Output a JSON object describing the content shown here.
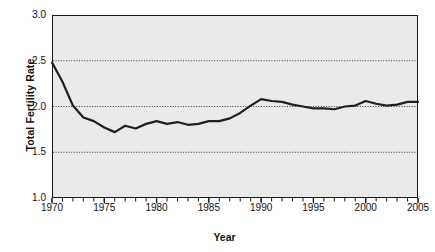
{
  "chart_data": {
    "type": "line",
    "title": "",
    "xlabel": "Year",
    "ylabel": "Total Fertility Rate",
    "xlim": [
      1970,
      2005
    ],
    "ylim": [
      1.0,
      3.0
    ],
    "xticks": [
      1970,
      1975,
      1980,
      1985,
      1990,
      1995,
      2000,
      2005
    ],
    "xtick_labels": [
      "1970",
      "1975",
      "1980",
      "1985",
      "1990",
      "1995",
      "2000",
      "2005"
    ],
    "minor_xtick_interval": 1,
    "yticks": [
      1.0,
      1.5,
      2.0,
      2.5,
      3.0
    ],
    "ytick_labels": [
      "1.0",
      "1.5",
      "2.0",
      "2.5",
      "3.0"
    ],
    "gridlines_y": [
      1.5,
      2.0,
      2.5
    ],
    "grid": "horizontal-dotted",
    "legend": "none",
    "plot_background": "#eaeaea",
    "line_color": "#1f1f1f",
    "axis_color": "#1a1a1a",
    "line_width": 2.2,
    "x": [
      1970,
      1971,
      1972,
      1973,
      1974,
      1975,
      1976,
      1977,
      1978,
      1979,
      1980,
      1981,
      1982,
      1983,
      1984,
      1985,
      1986,
      1987,
      1988,
      1989,
      1990,
      1991,
      1992,
      1993,
      1994,
      1995,
      1996,
      1997,
      1998,
      1999,
      2000,
      2001,
      2002,
      2003,
      2004,
      2005
    ],
    "values": [
      2.48,
      2.27,
      2.01,
      1.88,
      1.84,
      1.77,
      1.72,
      1.79,
      1.76,
      1.81,
      1.84,
      1.81,
      1.83,
      1.8,
      1.81,
      1.84,
      1.84,
      1.87,
      1.93,
      2.01,
      2.08,
      2.06,
      2.05,
      2.02,
      2.0,
      1.98,
      1.98,
      1.97,
      2.0,
      2.01,
      2.06,
      2.03,
      2.01,
      2.02,
      2.05,
      2.05
    ],
    "series_name": "Total Fertility Rate"
  },
  "axis": {
    "y_title": "Total Fertility Rate",
    "x_title": "Year"
  }
}
